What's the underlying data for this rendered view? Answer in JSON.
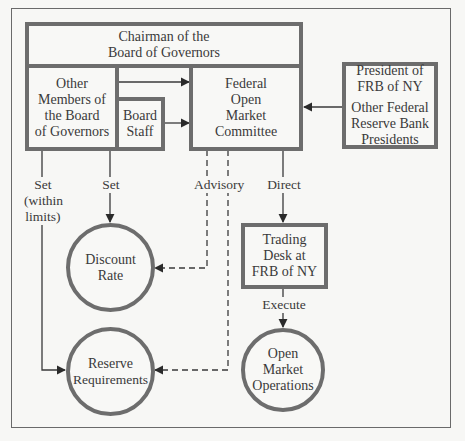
{
  "diagram": {
    "nodes": {
      "chairman": {
        "lines": [
          "Chairman of the",
          "Board of Governors"
        ]
      },
      "other_members": {
        "lines": [
          "Other",
          "Members of",
          "the Board",
          "of Governors"
        ]
      },
      "board_staff": {
        "lines": [
          "Board",
          "Staff"
        ]
      },
      "fomc": {
        "lines": [
          "Federal",
          "Open",
          "Market",
          "Committee"
        ]
      },
      "presidents": {
        "lines_top": [
          "President of",
          "FRB of NY"
        ],
        "lines_bottom": [
          "Other Federal",
          "Reserve Bank",
          "Presidents"
        ]
      },
      "trading_desk": {
        "lines": [
          "Trading",
          "Desk at",
          "FRB of NY"
        ]
      },
      "discount_rate": {
        "lines": [
          "Discount",
          "Rate"
        ]
      },
      "reserve_requirements": {
        "lines": [
          "Reserve",
          "Requirements"
        ]
      },
      "open_market_operations": {
        "lines": [
          "Open",
          "Market",
          "Operations"
        ]
      }
    },
    "edge_labels": {
      "set_within_limits": [
        "Set",
        "(within",
        "limits)"
      ],
      "set": [
        "Set"
      ],
      "advisory": [
        "Advisory"
      ],
      "direct": [
        "Direct"
      ],
      "execute": [
        "Execute"
      ]
    },
    "edges": [
      {
        "from": "chairman/other_members",
        "to": "fomc",
        "style": "solid"
      },
      {
        "from": "board_staff",
        "to": "fomc",
        "style": "solid"
      },
      {
        "from": "presidents",
        "to": "fomc",
        "style": "solid"
      },
      {
        "from": "other_members",
        "to": "reserve_requirements",
        "label": "Set (within limits)",
        "style": "solid"
      },
      {
        "from": "other_members",
        "to": "discount_rate",
        "label": "Set",
        "style": "solid"
      },
      {
        "from": "fomc",
        "to": "discount_rate",
        "label": "Advisory",
        "style": "dashed"
      },
      {
        "from": "fomc",
        "to": "reserve_requirements",
        "label": "Advisory",
        "style": "dashed"
      },
      {
        "from": "fomc",
        "to": "trading_desk",
        "label": "Direct",
        "style": "solid"
      },
      {
        "from": "trading_desk",
        "to": "open_market_operations",
        "label": "Execute",
        "style": "solid"
      }
    ],
    "colors": {
      "border": "#6d6d6d",
      "line": "#4a4a4a",
      "background": "#f7f7f5",
      "text": "#3a3a3a"
    }
  }
}
